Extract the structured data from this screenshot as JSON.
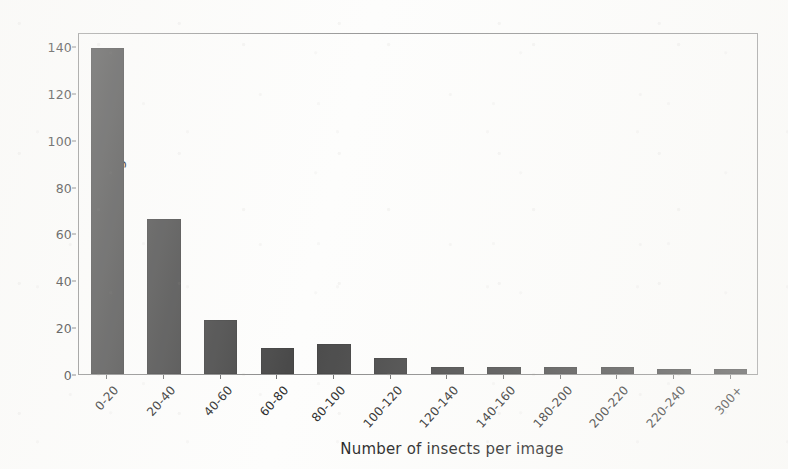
{
  "chart_data": {
    "type": "bar",
    "title": "",
    "xlabel": "Number of insects per image",
    "ylabel": "Number of images",
    "categories": [
      "0-20",
      "20-40",
      "40-60",
      "60-80",
      "80-100",
      "100-120",
      "120-140",
      "140-160",
      "180-200",
      "200-220",
      "220-240",
      "300+"
    ],
    "values": [
      139,
      66,
      23,
      11,
      13,
      7,
      3,
      3,
      3,
      3,
      2,
      2
    ],
    "ylim": [
      0,
      146
    ],
    "yticks": [
      0,
      20,
      40,
      60,
      80,
      100,
      120,
      140
    ],
    "ytick_labels": [
      "0",
      "20",
      "40",
      "60",
      "80",
      "100",
      "120",
      "140"
    ],
    "xtick_rotation": -48,
    "grid": false,
    "legend": false,
    "legend_position": "none",
    "bar_color": "#4a4a4a",
    "axis_color": "#8d8d8d",
    "background_color": "#fdfdfc"
  }
}
